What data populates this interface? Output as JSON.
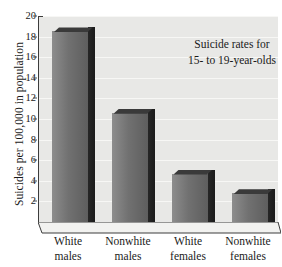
{
  "chart_data": {
    "type": "bar",
    "title": "Suicide rates for 15- to 19-year-olds",
    "title_line1": "Suicide rates for",
    "title_line2": "15- to 19-year-olds",
    "xlabel": "",
    "ylabel": "Suicides per 100,000 in population",
    "categories": [
      "White males",
      "Nonwhite males",
      "White females",
      "Nonwhite females"
    ],
    "category_lines": [
      [
        "White",
        "males"
      ],
      [
        "Nonwhite",
        "males"
      ],
      [
        "White",
        "females"
      ],
      [
        "Nonwhite",
        "females"
      ]
    ],
    "values": [
      18.5,
      10.6,
      4.7,
      2.8
    ],
    "ylim": [
      0,
      20
    ],
    "yticks": [
      2,
      4,
      6,
      8,
      10,
      12,
      14,
      16,
      18,
      20
    ],
    "ytick_labels": [
      "2",
      "4",
      "6",
      "8",
      "10",
      "12",
      "14",
      "16",
      "18",
      "20"
    ],
    "grid": true,
    "legend": false,
    "style": {
      "bar_face_light": "#8d8d8d",
      "bar_face_dark": "#5e5e5e",
      "bar_side": "#1f1f1f",
      "plot_background": "#e8e8e6",
      "gridline_color": "#f7f7f5",
      "axis_color": "#3c3c3c",
      "text_color": "#1a1a1a",
      "page_background": "#ffffff"
    }
  }
}
